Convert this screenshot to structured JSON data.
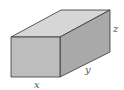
{
  "diagram": {
    "type": "rectangular-box",
    "labels": {
      "width": "x",
      "depth": "y",
      "height": "z"
    },
    "colors": {
      "front_face": "#bdbdbd",
      "top_face": "#d6d6d6",
      "side_face": "#a9a9a9",
      "edge": "#333333"
    }
  }
}
